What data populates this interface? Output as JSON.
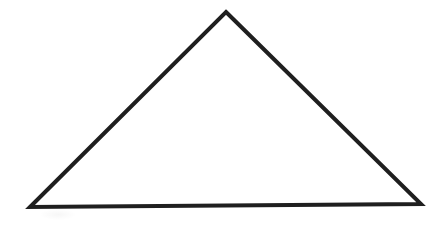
{
  "canvas": {
    "width": 444,
    "height": 226,
    "background_color": "#ffffff",
    "description": "Plain white page containing a single hand-drawn triangle outline"
  },
  "figure": {
    "name": "triangle",
    "shape_type": "triangle",
    "classification": "isosceles-like acute triangle, apex at top",
    "filled": false,
    "fill_color": "none",
    "stroke_color": "#1f1f1f",
    "stroke_width": 4,
    "stroke_linejoin": "miter",
    "stroke_linecap": "butt",
    "vertices": [
      {
        "label": "apex",
        "x": 226,
        "y": 12
      },
      {
        "label": "bottom-right",
        "x": 421,
        "y": 204
      },
      {
        "label": "bottom-left",
        "x": 30,
        "y": 207
      }
    ],
    "points_attr": "226,12 421,204 30,207",
    "edges": [
      {
        "label": "left-side",
        "from": "bottom-left",
        "to": "apex"
      },
      {
        "label": "right-side",
        "from": "apex",
        "to": "bottom-right"
      },
      {
        "label": "base",
        "from": "bottom-left",
        "to": "bottom-right"
      }
    ],
    "bounding_box": {
      "x": 30,
      "y": 12,
      "width": 391,
      "height": 195
    }
  },
  "artifacts": {
    "smudge": {
      "name": "scan-smudge",
      "color": "rgba(0,0,0,0.035)",
      "x": 40,
      "y": 209,
      "width": 36,
      "height": 11
    }
  }
}
